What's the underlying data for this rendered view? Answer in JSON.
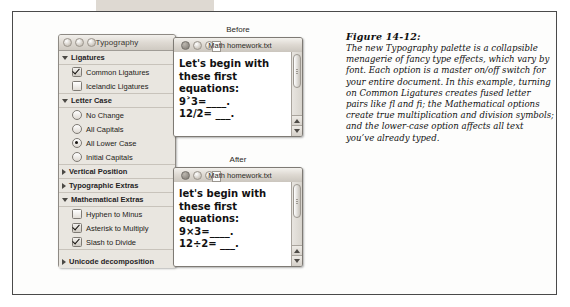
{
  "figure": {
    "heading": "Figure 14-12:",
    "caption": "The new Typography palette is a collapsible menagerie of fancy type effects, which vary by font. Each option is a master on/off switch for your entire document. In this example, turning on Common Ligatures creates fused letter pairs like fl and fi; the Mathematical options create true multiplication and division symbols; and the lower-case option affects all text you’ve already typed."
  },
  "palette": {
    "title": "Typography",
    "window_controls": [
      "close-dot",
      "minimize-dot",
      "zoom-dot"
    ],
    "sections": [
      {
        "label": "Ligatures",
        "expanded": true,
        "control_type": "checkbox",
        "options": [
          {
            "label": "Common Ligatures",
            "checked": true
          },
          {
            "label": "Icelandic Ligatures",
            "checked": false
          }
        ]
      },
      {
        "label": "Letter Case",
        "expanded": true,
        "control_type": "radio",
        "options": [
          {
            "label": "No Change",
            "checked": false
          },
          {
            "label": "All Capitals",
            "checked": false
          },
          {
            "label": "All Lower Case",
            "checked": true
          },
          {
            "label": "Initial Capitals",
            "checked": false
          }
        ]
      },
      {
        "label": "Vertical Position",
        "expanded": false,
        "control_type": "none",
        "options": []
      },
      {
        "label": "Typographic Extras",
        "expanded": false,
        "control_type": "none",
        "options": []
      },
      {
        "label": "Mathematical Extras",
        "expanded": true,
        "control_type": "checkbox",
        "options": [
          {
            "label": "Hyphen to Minus",
            "checked": false
          },
          {
            "label": "Asterisk to Multiply",
            "checked": true
          },
          {
            "label": "Slash to Divide",
            "checked": true
          }
        ]
      },
      {
        "label": "Unicode decomposition",
        "expanded": false,
        "control_type": "none",
        "options": []
      }
    ]
  },
  "documents": [
    {
      "caption": "Before",
      "window_title": "Math homework.txt",
      "text": "Let's begin with these first equations:\n9˃3=____.\n12/2= ___."
    },
    {
      "caption": "After",
      "window_title": "Math homework.txt",
      "text": "let's begin with these ﬁrst equations:\n9×3=____.\n12÷2= ___."
    }
  ],
  "colors": {
    "page_background": "#ffffff",
    "figure_border": "#4a4a4a",
    "palette_background": "#e9e6e0",
    "titlebar_gradient_top": "#f3f1ed",
    "titlebar_gradient_bottom": "#cbc6be",
    "text": "#111111"
  }
}
